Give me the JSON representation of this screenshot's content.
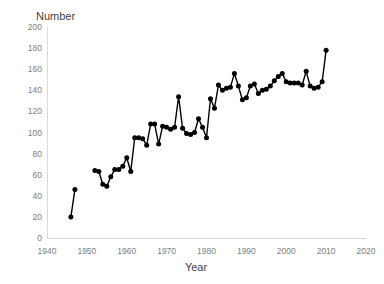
{
  "chart_data": {
    "type": "line",
    "title": "",
    "subtitle": "",
    "xlabel": "Year",
    "ylabel": "Number",
    "ylabel_position": "top-left",
    "xlim": [
      1940,
      2020
    ],
    "ylim": [
      0,
      200
    ],
    "xticks": [
      1940,
      1950,
      1960,
      1970,
      1980,
      1990,
      2000,
      2010,
      2020
    ],
    "yticks": [
      0,
      20,
      40,
      60,
      80,
      100,
      120,
      140,
      160,
      180,
      200
    ],
    "xtick_labels": [
      "1940",
      "1950",
      "1960",
      "1970",
      "1980",
      "1990",
      "2000",
      "2010",
      "2020"
    ],
    "ytick_labels": [
      "0",
      "20",
      "40",
      "60",
      "80",
      "100",
      "120",
      "140",
      "160",
      "180",
      "200"
    ],
    "grid": false,
    "legend": false,
    "legend_position": "none",
    "marker": "circle",
    "line_color": "#000000",
    "marker_color": "#000000",
    "axis_color": "#d9d9d9",
    "tick_label_color": "#808080",
    "background_color": "#ffffff",
    "series": [
      {
        "name": "Number",
        "segments": [
          {
            "x": [
              1946,
              1947
            ],
            "y": [
              20,
              46
            ]
          },
          {
            "x": [
              1952,
              1953,
              1954,
              1955,
              1956,
              1957,
              1958,
              1959,
              1960,
              1961,
              1962,
              1963,
              1964,
              1965,
              1966,
              1967,
              1968,
              1969,
              1970,
              1971,
              1972,
              1973,
              1974,
              1975,
              1976,
              1977,
              1978,
              1979,
              1980,
              1981,
              1982,
              1983,
              1984,
              1985,
              1986,
              1987,
              1988,
              1989,
              1990,
              1991,
              1992,
              1993,
              1994,
              1995,
              1996,
              1997,
              1998,
              1999,
              2000,
              2001,
              2002,
              2003,
              2004,
              2005,
              2006,
              2007,
              2008,
              2009,
              2010
            ],
            "y": [
              64,
              63,
              51,
              49,
              58,
              65,
              65,
              68,
              76,
              63,
              95,
              95,
              94,
              88,
              108,
              108,
              89,
              106,
              105,
              103,
              105,
              134,
              104,
              99,
              98,
              100,
              113,
              105,
              95,
              132,
              123,
              145,
              140,
              142,
              143,
              156,
              144,
              131,
              133,
              144,
              146,
              137,
              140,
              141,
              144,
              149,
              153,
              156,
              148,
              147,
              147,
              147,
              145,
              158,
              144,
              142,
              143,
              148,
              178
            ]
          }
        ]
      }
    ]
  },
  "figure": {
    "plot_left": 47,
    "plot_right": 366,
    "plot_top": 27,
    "plot_bottom": 238
  }
}
